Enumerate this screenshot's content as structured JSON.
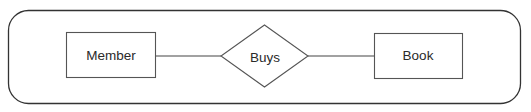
{
  "diagram": {
    "type": "er-diagram",
    "container": {
      "shape": "rounded-rectangle",
      "x": 8,
      "y": 10,
      "width": 513,
      "height": 94,
      "radius": 20,
      "stroke": "#333333"
    },
    "entities": [
      {
        "id": "member",
        "label": "Member",
        "shape": "rectangle",
        "x": 66,
        "y": 32,
        "width": 89,
        "height": 45
      },
      {
        "id": "book",
        "label": "Book",
        "shape": "rectangle",
        "x": 374,
        "y": 33,
        "width": 88,
        "height": 45
      }
    ],
    "relationships": [
      {
        "id": "buys",
        "label": "Buys",
        "shape": "diamond",
        "cx": 264.5,
        "cy": 56,
        "half_width": 43.5,
        "half_height": 31
      }
    ],
    "connectors": [
      {
        "from": "member",
        "to": "buys",
        "x1": 155,
        "y1": 56,
        "x2": 221,
        "y2": 56
      },
      {
        "from": "buys",
        "to": "book",
        "x1": 308,
        "y1": 56,
        "x2": 374,
        "y2": 56
      }
    ],
    "colors": {
      "stroke": "#555555",
      "text": "#2a2a2a",
      "background": "#ffffff"
    }
  }
}
